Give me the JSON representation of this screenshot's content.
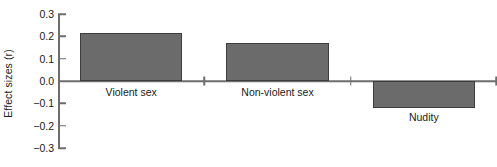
{
  "chart_data": {
    "type": "bar",
    "title": "",
    "subtitle": "",
    "xlabel": "",
    "ylabel": "Effect sizes (r)",
    "categories": [
      "Violent sex",
      "Non-violent sex",
      "Nudity"
    ],
    "values": [
      0.215,
      0.17,
      -0.12
    ],
    "ylim": [
      -0.3,
      0.3
    ],
    "yticks": [
      0.3,
      0.2,
      0.1,
      0.0,
      -0.1,
      -0.2,
      -0.3
    ],
    "ytick_labels": [
      "0.3",
      "0.2",
      "0.1",
      "0.0",
      "−0.1",
      "−0.2",
      "−0.3"
    ],
    "grid": false,
    "legend": false,
    "legend_position": "none",
    "bar_color": "#6b6b6b",
    "bar_edge_color": "#3d3d3d",
    "axis_color": "#6d6d6d",
    "text_color": "#1a1a1a",
    "background_color": "#ffffff",
    "series": [
      {
        "name": "Effect size",
        "values": [
          0.215,
          0.17,
          -0.12
        ]
      }
    ],
    "annotations": []
  }
}
